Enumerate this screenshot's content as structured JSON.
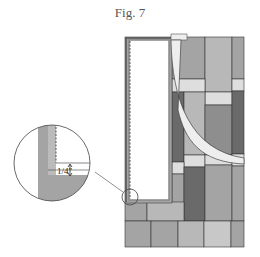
{
  "figure": {
    "title": "Fig. 7",
    "inset_label": "1/4\"",
    "colors": {
      "white": "#ffffff",
      "light": "#dedede",
      "mid_light": "#b8b8b8",
      "mid": "#a4a4a4",
      "mid_dark": "#8e8e8e",
      "dark": "#6a6a6a",
      "line": "#333333"
    }
  }
}
